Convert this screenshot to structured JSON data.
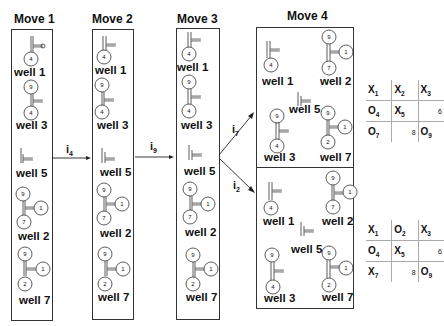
{
  "moves": [
    {
      "title": "Move 1",
      "wells": [
        {
          "label": "well 1",
          "circles": [
            "4"
          ]
        },
        {
          "label": "well 3",
          "circles": [
            "9",
            "4"
          ]
        },
        {
          "label": "well 5",
          "circles": []
        },
        {
          "label": "well 2",
          "circles": [
            "9",
            "1",
            "7"
          ]
        },
        {
          "label": "well 7",
          "circles": [
            "9",
            "1",
            "2"
          ]
        }
      ]
    },
    {
      "title": "Move 2",
      "wells": [
        {
          "label": "well 1",
          "circles": [
            "4"
          ]
        },
        {
          "label": "well 3",
          "circles": [
            "9",
            "4"
          ]
        },
        {
          "label": "well 5",
          "circles": []
        },
        {
          "label": "well 2",
          "circles": [
            "9",
            "1",
            "7"
          ]
        },
        {
          "label": "well 7",
          "circles": [
            "9",
            "1",
            "2"
          ]
        }
      ]
    },
    {
      "title": "Move 3",
      "wells": [
        {
          "label": "well 1",
          "circles": [
            "4"
          ]
        },
        {
          "label": "well 3",
          "circles": [
            "9",
            "4"
          ]
        },
        {
          "label": "well 5",
          "circles": []
        },
        {
          "label": "well 2",
          "circles": [
            "9",
            "1",
            "7"
          ]
        },
        {
          "label": "well 7",
          "circles": [
            "9",
            "1",
            "2"
          ]
        }
      ]
    },
    {
      "title": "Move 4",
      "branches": [
        {
          "wells": [
            {
              "label": "well 1",
              "circles": [
                "4"
              ]
            },
            {
              "label": "well 2",
              "circles": [
                "9",
                "1",
                "7"
              ]
            },
            {
              "label": "well 5",
              "circles": []
            },
            {
              "label": "well 3",
              "circles": [
                "9",
                "4"
              ]
            },
            {
              "label": "well 7",
              "circles": [
                "9",
                "1",
                "2"
              ]
            }
          ]
        },
        {
          "wells": [
            {
              "label": "well 1",
              "circles": [
                "4"
              ]
            },
            {
              "label": "well 2",
              "circles": [
                "9",
                "1",
                "7"
              ]
            },
            {
              "label": "well 5",
              "circles": []
            },
            {
              "label": "well 3",
              "circles": [
                "9",
                "4"
              ]
            },
            {
              "label": "well 7",
              "circles": [
                "9",
                "1",
                "2"
              ]
            }
          ]
        }
      ]
    }
  ],
  "arrows": [
    {
      "label": "i",
      "sub": "4"
    },
    {
      "label": "i",
      "sub": "9"
    },
    {
      "label": "i",
      "sub": "7"
    },
    {
      "label": "i",
      "sub": "2"
    }
  ],
  "boards": [
    {
      "rows": [
        [
          {
            "m": "X",
            "s": "1"
          },
          {
            "m": "X",
            "s": "2"
          },
          {
            "m": "X",
            "s": "3"
          }
        ],
        [
          {
            "m": "O",
            "s": "4"
          },
          {
            "m": "X",
            "s": "5"
          },
          {
            "n": "6"
          }
        ],
        [
          {
            "m": "O",
            "s": "7"
          },
          {
            "n": "8"
          },
          {
            "m": "O",
            "s": "9"
          }
        ]
      ]
    },
    {
      "rows": [
        [
          {
            "m": "X",
            "s": "1"
          },
          {
            "m": "O",
            "s": "2"
          },
          {
            "m": "X",
            "s": "3"
          }
        ],
        [
          {
            "m": "O",
            "s": "4"
          },
          {
            "m": "X",
            "s": "5"
          },
          {
            "n": "6"
          }
        ],
        [
          {
            "m": "X",
            "s": "7"
          },
          {
            "n": "8"
          },
          {
            "m": "O",
            "s": "9"
          }
        ]
      ]
    }
  ]
}
